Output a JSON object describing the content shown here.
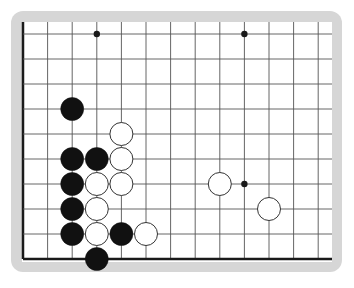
{
  "board": {
    "type": "go-board-fragment",
    "columns": 13,
    "rows": 10,
    "origin_x": 23,
    "origin_y": 34,
    "spacing_x": 24.6,
    "spacing_y": 25,
    "stone_radius": 11.5,
    "edges": {
      "left": true,
      "bottom": true,
      "top": false,
      "right": false
    },
    "colors": {
      "frame": "#d6d6d6",
      "board": "#ffffff",
      "grid": "#555555",
      "edge": "#1a1a1a",
      "black_stone": "#111111",
      "white_stone": "#ffffff",
      "white_stone_outline": "#333333"
    },
    "star_points": [
      [
        3,
        0
      ],
      [
        9,
        0
      ],
      [
        9,
        6
      ]
    ],
    "stones": [
      {
        "color": "black",
        "col": 2,
        "row": 3
      },
      {
        "color": "white",
        "col": 4,
        "row": 4
      },
      {
        "color": "black",
        "col": 2,
        "row": 5
      },
      {
        "color": "black",
        "col": 3,
        "row": 5
      },
      {
        "color": "white",
        "col": 4,
        "row": 5
      },
      {
        "color": "black",
        "col": 2,
        "row": 6
      },
      {
        "color": "white",
        "col": 3,
        "row": 6
      },
      {
        "color": "white",
        "col": 4,
        "row": 6
      },
      {
        "color": "black",
        "col": 2,
        "row": 7
      },
      {
        "color": "white",
        "col": 3,
        "row": 7
      },
      {
        "color": "black",
        "col": 2,
        "row": 8
      },
      {
        "color": "white",
        "col": 3,
        "row": 8
      },
      {
        "color": "black",
        "col": 4,
        "row": 8
      },
      {
        "color": "white",
        "col": 5,
        "row": 8
      },
      {
        "color": "black",
        "col": 3,
        "row": 9
      },
      {
        "color": "white",
        "col": 8,
        "row": 6
      },
      {
        "color": "white",
        "col": 10,
        "row": 7
      }
    ]
  }
}
